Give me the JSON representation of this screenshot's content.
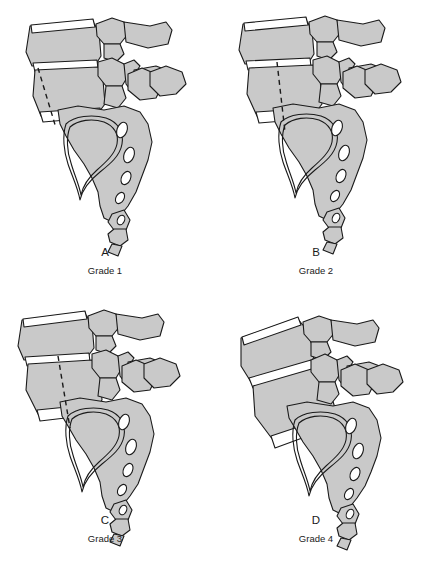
{
  "figure": {
    "background_color": "#ffffff",
    "bone_fill_color": "#c9c9c9",
    "bone_fill_dark": "#bdbdbd",
    "outline_color": "#1a1a1a",
    "disc_fill_color": "#ffffff",
    "label_color": "#1a1a1a"
  },
  "panels": [
    {
      "id": "panel-a",
      "letter": "A",
      "grade": "Grade 1",
      "slip_fraction": 0.25,
      "has_reference_line": true
    },
    {
      "id": "panel-b",
      "letter": "B",
      "grade": "Grade 2",
      "slip_fraction": 0.5,
      "has_reference_line": true
    },
    {
      "id": "panel-c",
      "letter": "C",
      "grade": "Grade 3",
      "slip_fraction": 0.75,
      "has_reference_line": true
    },
    {
      "id": "panel-d",
      "letter": "D",
      "grade": "Grade 4",
      "slip_fraction": 1.0,
      "has_reference_line": false
    }
  ]
}
